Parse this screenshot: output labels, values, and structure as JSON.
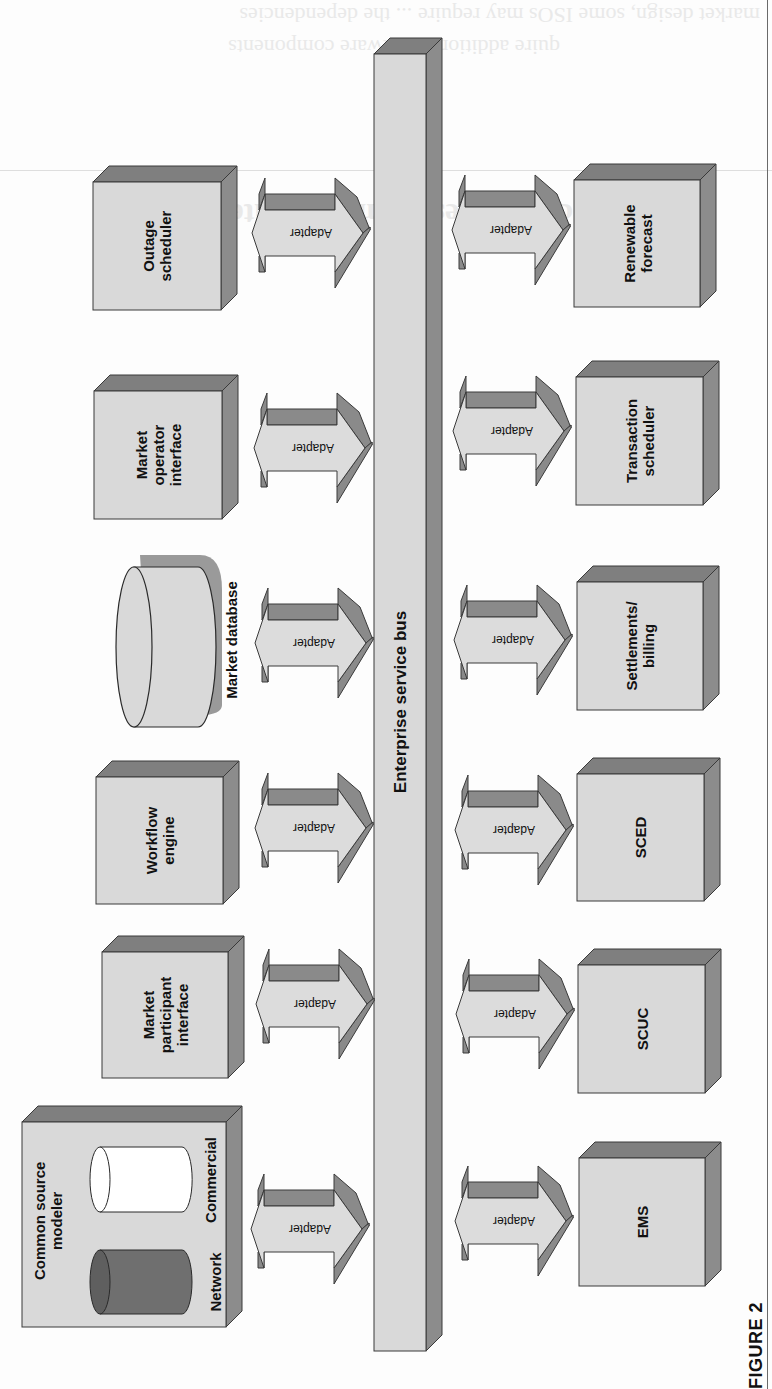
{
  "figure": {
    "label": "FIGURE 2",
    "orientation": "rotated 90 degrees counter-clockwise"
  },
  "bus": {
    "label": "Enterprise service bus"
  },
  "adapter_label": "Adapter",
  "components_top_row": [
    {
      "id": "outage-scheduler",
      "label": "Outage\nscheduler"
    },
    {
      "id": "market-operator-interface",
      "label": "Market\noperator\ninterface"
    },
    {
      "id": "market-database",
      "label": "Market database",
      "shape": "cylinder"
    },
    {
      "id": "workflow-engine",
      "label": "Workflow\nengine"
    },
    {
      "id": "market-participant-interface",
      "label": "Market\nparticipant\ninterface"
    },
    {
      "id": "common-source-modeler",
      "label": "Common source\nmodeler",
      "contains": [
        {
          "id": "network-db",
          "label": "Network",
          "fill": "#6f6f6f"
        },
        {
          "id": "commercial-db",
          "label": "Commercial",
          "fill": "#ffffff"
        }
      ]
    }
  ],
  "components_bottom_row": [
    {
      "id": "renewable-forecast",
      "label": "Renewable\nforecast"
    },
    {
      "id": "transaction-scheduler",
      "label": "Transaction\nscheduler"
    },
    {
      "id": "settlements-billing",
      "label": "Settlements/\nbilling"
    },
    {
      "id": "sced",
      "label": "SCED"
    },
    {
      "id": "scuc",
      "label": "SCUC"
    },
    {
      "id": "ems",
      "label": "EMS"
    }
  ],
  "colors": {
    "front_face": "#d9d9d9",
    "side_face": "#8c8c8c",
    "top_face": "#7f7f7f",
    "outline": "#3a3a3a",
    "adapter_fill": "#dcdcdc",
    "adapter_shade": "#8a8a8a",
    "network_db": "#6f6f6f",
    "commercial_db": "#ffffff"
  },
  "ghost_bleedthrough": {
    "heading": "ration challenges from ESB integration",
    "line1": "hitecture ... allows ... enables ... to dis ... nguages ...",
    "line2": "ISO ... New England ... example ... adopted ...",
    "top1": "market design, some ISOs may require ... the dependencies",
    "top2": "quire additional software components"
  }
}
